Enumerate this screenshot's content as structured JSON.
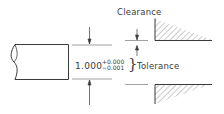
{
  "diagram": {
    "type": "engineering-fit-diagram",
    "labels": {
      "clearance": "Clearance",
      "tolerance": "Tolerance"
    },
    "dimension": {
      "nominal": "1.000",
      "upper_deviation": "+0.000",
      "lower_deviation": "−0.001",
      "brace": "}"
    },
    "parts": [
      {
        "name": "shaft",
        "description": "Shaft with break line on left end"
      },
      {
        "name": "hole-upper-wall",
        "description": "Hatched section of mating part, upper"
      },
      {
        "name": "hole-lower-wall",
        "description": "Hatched section of mating part, lower"
      }
    ],
    "colors": {
      "line": "#3a3a3a",
      "hatch": "#6a6a6a",
      "background": "#ffffff"
    }
  }
}
